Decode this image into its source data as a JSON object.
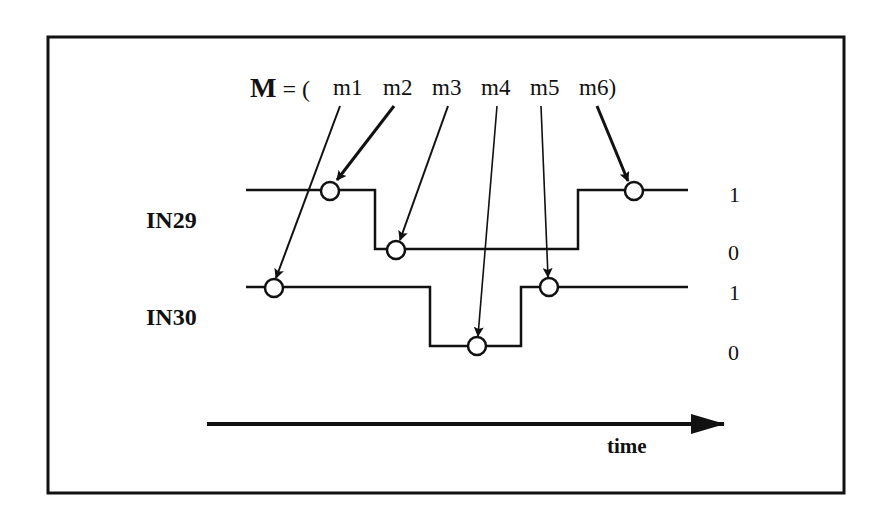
{
  "title": {
    "prefix": "M",
    "equals": "=",
    "open": "(",
    "items": [
      "m1",
      "m2",
      "m3",
      "m4",
      "m5",
      "m6"
    ],
    "close": ")"
  },
  "signals": [
    {
      "name": "IN29",
      "levels": [
        "1",
        "0"
      ]
    },
    {
      "name": "IN30",
      "levels": [
        "1",
        "0"
      ]
    }
  ],
  "axis": {
    "label": "time"
  },
  "colors": {
    "ink": "#111111",
    "background": "#ffffff"
  },
  "markers": [
    {
      "id": "m1",
      "signal": "IN30",
      "level": "1"
    },
    {
      "id": "m2",
      "signal": "IN29",
      "level": "1"
    },
    {
      "id": "m3",
      "signal": "IN29",
      "level": "0"
    },
    {
      "id": "m4",
      "signal": "IN30",
      "level": "0"
    },
    {
      "id": "m5",
      "signal": "IN30",
      "level": "1"
    },
    {
      "id": "m6",
      "signal": "IN29",
      "level": "1"
    }
  ]
}
